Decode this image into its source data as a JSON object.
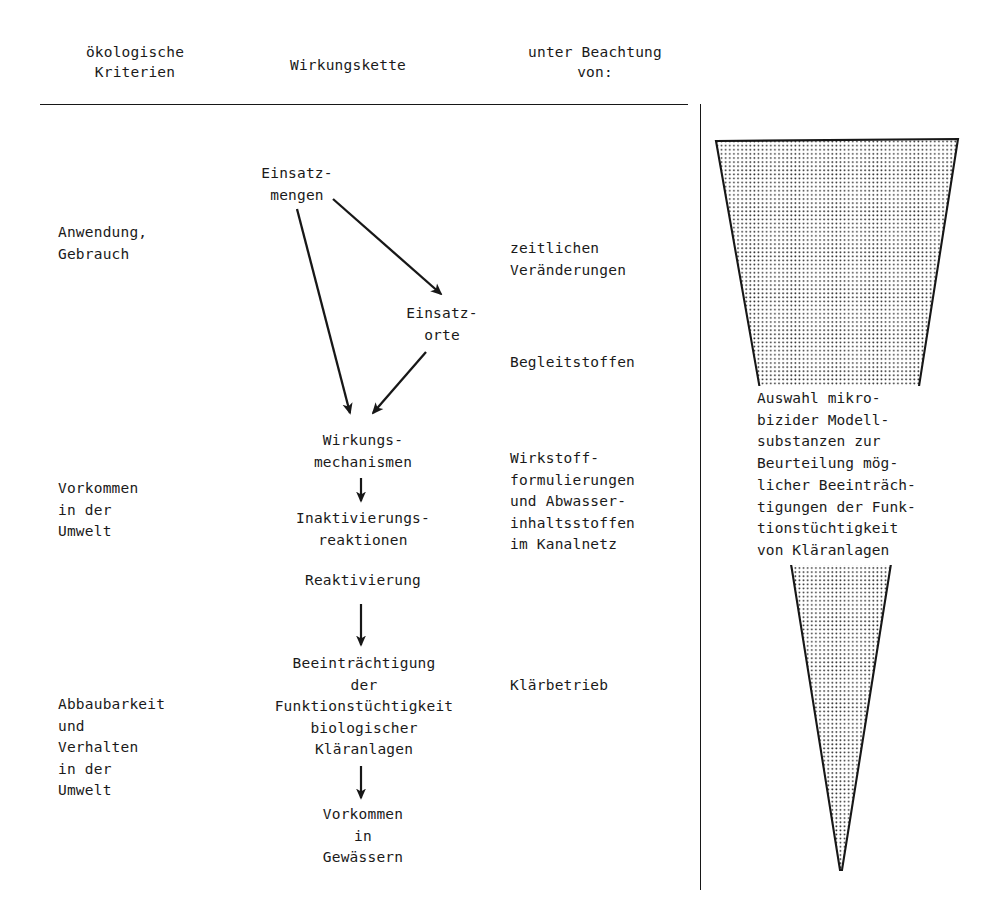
{
  "diagram": {
    "headers": {
      "criteria": "ökologische\nKriterien",
      "chain": "Wirkungskette",
      "consideration": "unter Beachtung\nvon:"
    },
    "criteria_column": [
      {
        "id": "anwendung",
        "text": "Anwendung,\nGebrauch"
      },
      {
        "id": "vorkommen",
        "text": "Vorkommen\nin der\nUmwelt"
      },
      {
        "id": "abbaubarkeit",
        "text": "Abbaubarkeit\nund\nVerhalten\nin der\nUmwelt"
      }
    ],
    "chain_nodes": [
      {
        "id": "einsatzmengen",
        "text": "Einsatz-\nmengen"
      },
      {
        "id": "einsatzorte",
        "text": "Einsatz-\norte"
      },
      {
        "id": "wirkungsmechanismen",
        "text": "Wirkungs-\nmechanismen"
      },
      {
        "id": "inaktivierungsreaktionen",
        "text": "Inaktivierungs-\nreaktionen"
      },
      {
        "id": "reaktivierung",
        "text": "Reaktivierung"
      },
      {
        "id": "beeintraechtigung",
        "text": "Beeinträchtigung\nder\nFunktionstüchtigkeit\nbiologischer\nKläranlagen"
      },
      {
        "id": "vorkommen-gewaessern",
        "text": "Vorkommen\nin\nGewässern"
      }
    ],
    "consideration_column": [
      {
        "id": "zeitliche",
        "text": "zeitlichen\nVeränderungen"
      },
      {
        "id": "begleitstoffen",
        "text": "Begleitstoffen"
      },
      {
        "id": "wirkstoff",
        "text": "Wirkstoff-\nformulierungen\nund Abwasser-\ninhaltsstoffen\nim Kanalnetz"
      },
      {
        "id": "klaerbetrieb",
        "text": "Klärbetrieb"
      }
    ],
    "funnel": {
      "caption": "Auswahl mikro-\nbizider Modell-\nsubstanzen zur\nBeurteilung mög-\nlicher Beeinträch-\ntigungen der Funk-\ntionstüchtigkeit\nvon Kläranlagen",
      "fill_color": "#d8d8d8",
      "stroke_color": "#171717"
    },
    "arrows": [
      {
        "id": "mengen-to-orte",
        "from": "einsatzmengen",
        "to": "einsatzorte"
      },
      {
        "id": "mengen-to-mechanismen",
        "from": "einsatzmengen",
        "to": "wirkungsmechanismen"
      },
      {
        "id": "orte-to-mechanismen",
        "from": "einsatzorte",
        "to": "wirkungsmechanismen"
      },
      {
        "id": "mechanismen-to-inaktivierung",
        "from": "wirkungsmechanismen",
        "to": "inaktivierungsreaktionen"
      },
      {
        "id": "reaktivierung-to-beeintraechtigung",
        "from": "reaktivierung",
        "to": "beeintraechtigung"
      },
      {
        "id": "beeintraechtigung-to-vorkommen",
        "from": "beeintraechtigung",
        "to": "vorkommen-gewaessern"
      }
    ]
  }
}
